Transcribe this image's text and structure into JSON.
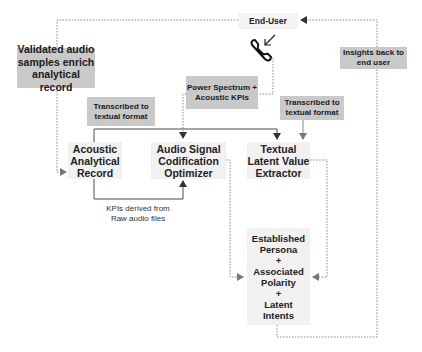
{
  "nodes": {
    "end_user": "End-User",
    "acoustic_record": [
      "Acoustic",
      "Analytical",
      "Record"
    ],
    "audio_optimizer": [
      "Audio Signal",
      "Codification",
      "Optimizer"
    ],
    "textual_extractor": [
      "Textual",
      "Latent Value",
      "Extractor"
    ],
    "persona_output": [
      "Established",
      "Persona",
      "+",
      "Associated",
      "Polarity",
      "+",
      "Latent",
      "Intents"
    ]
  },
  "edge_labels": {
    "validated_samples": [
      "Validated audio",
      "samples enrich",
      "analytical record"
    ],
    "power_spectrum": [
      "Power Spectrum +",
      "Acoustic KPIs"
    ],
    "transcribed_left": [
      "Transcribed to",
      "textual format"
    ],
    "transcribed_right": [
      "Transcribed to",
      "textual format"
    ],
    "insights_back": [
      "Insights back to",
      "end user"
    ],
    "kpis_derived": [
      "KPIs derived from",
      "Raw audio files"
    ]
  },
  "icons": {
    "phone": "phone-incoming-icon"
  },
  "colors": {
    "label_bg": "#c9c9c9",
    "node_bg": "#f1f1f1",
    "solid_line": "#4a4a4a",
    "dotted_line": "#8a8a8a"
  }
}
